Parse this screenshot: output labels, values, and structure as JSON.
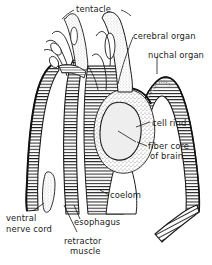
{
  "figure": {
    "background_color": "#ffffff",
    "line_color": "#1a1a1a",
    "stipple_color": "#9a9a9a",
    "fiber_core_fill": "#ececec"
  },
  "labels": [
    {
      "id": "tentacle",
      "text": "tentacle",
      "x": 76,
      "y": 4
    },
    {
      "id": "cerebral-organ",
      "text": "cerebral organ",
      "x": 133,
      "y": 31
    },
    {
      "id": "nuchal-organ",
      "text": "nuchal organ",
      "x": 148,
      "y": 50
    },
    {
      "id": "cell-rind",
      "text": "cell rind",
      "x": 152,
      "y": 118
    },
    {
      "id": "fiber-core-line1",
      "text": "fiber core",
      "x": 148,
      "y": 141
    },
    {
      "id": "fiber-core-line2",
      "text": "of brain",
      "x": 150,
      "y": 151
    },
    {
      "id": "coelom",
      "text": "coelom",
      "x": 110,
      "y": 190
    },
    {
      "id": "ventral-line1",
      "text": "ventral",
      "x": 6,
      "y": 213
    },
    {
      "id": "ventral-line2",
      "text": "nerve cord",
      "x": 6,
      "y": 224
    },
    {
      "id": "esophagus",
      "text": "esophagus",
      "x": 74,
      "y": 217
    },
    {
      "id": "retractor-line1",
      "text": "retractor",
      "x": 64,
      "y": 236
    },
    {
      "id": "retractor-line2",
      "text": "muscle",
      "x": 70,
      "y": 246
    }
  ],
  "structures": [
    {
      "id": "tentacle",
      "name": "tentacle"
    },
    {
      "id": "cerebral-organ",
      "name": "cerebral organ"
    },
    {
      "id": "nuchal-organ",
      "name": "nuchal organ"
    },
    {
      "id": "cell-rind",
      "name": "cell rind"
    },
    {
      "id": "fiber-core-of-brain",
      "name": "fiber core of brain"
    },
    {
      "id": "coelom",
      "name": "coelom"
    },
    {
      "id": "esophagus",
      "name": "esophagus"
    },
    {
      "id": "retractor-muscle",
      "name": "retractor muscle"
    },
    {
      "id": "ventral-nerve-cord",
      "name": "ventral nerve cord"
    }
  ]
}
